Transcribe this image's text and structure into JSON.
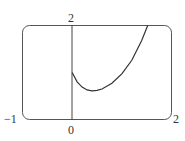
{
  "chart_data": {
    "type": "line",
    "title": "",
    "xlabel": "",
    "ylabel": "",
    "xlim": [
      -1,
      2
    ],
    "ylim": [
      0,
      2
    ],
    "grid": false,
    "legend": null,
    "tick_labels": {
      "x_min": "−1",
      "x_zero": "0",
      "x_max": "2",
      "y_max": "2"
    },
    "series": [
      {
        "name": "curve",
        "x": [
          0,
          0.1,
          0.2,
          0.3,
          0.4,
          0.5,
          0.6,
          0.8,
          1.0,
          1.2,
          1.4,
          1.52
        ],
        "y": [
          1.0,
          0.8,
          0.69,
          0.63,
          0.61,
          0.62,
          0.65,
          0.77,
          0.97,
          1.26,
          1.68,
          2.0
        ]
      }
    ]
  }
}
